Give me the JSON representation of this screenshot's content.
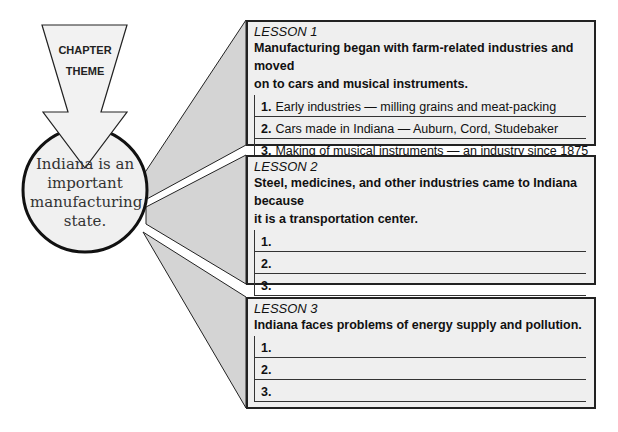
{
  "theme": {
    "arrow_label_line1": "CHAPTER",
    "arrow_label_line2": "THEME",
    "statement_lines": [
      "Indiana is an",
      "important",
      "manufacturing",
      "state."
    ]
  },
  "lessons": [
    {
      "title": "LESSON 1",
      "main_idea": [
        "Manufacturing began with farm-related industries and moved",
        "on to cars and musical instruments."
      ],
      "items": [
        {
          "num": "1.",
          "text": "Early industries — milling grains and meat-packing"
        },
        {
          "num": "2.",
          "text": "Cars made in Indiana — Auburn, Cord, Studebaker"
        },
        {
          "num": "3.",
          "text": "Making of musical instruments — an industry since 1875"
        }
      ]
    },
    {
      "title": "LESSON 2",
      "main_idea": [
        "Steel, medicines, and other industries came to Indiana because",
        "it is a transportation center."
      ],
      "items": [
        {
          "num": "1.",
          "text": ""
        },
        {
          "num": "2.",
          "text": ""
        },
        {
          "num": "3.",
          "text": ""
        }
      ]
    },
    {
      "title": "LESSON 3",
      "main_idea": [
        "Indiana faces problems of energy supply and pollution."
      ],
      "items": [
        {
          "num": "1.",
          "text": ""
        },
        {
          "num": "2.",
          "text": ""
        },
        {
          "num": "3.",
          "text": ""
        }
      ]
    }
  ],
  "colors": {
    "wedge_fill": "#d4d4d4",
    "box_fill": "#efefef",
    "circle_fill": "#f0f0f0",
    "stroke": "#222222"
  }
}
